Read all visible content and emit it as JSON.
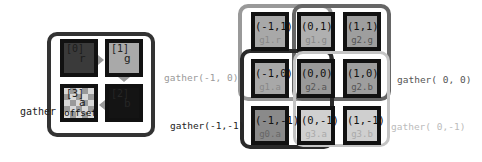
{
  "left_panel": {
    "label": "gather",
    "cells": [
      {
        "index": "[0]",
        "channel": "r",
        "color": "#3a3a3a"
      },
      {
        "index": "[1]",
        "channel": "g",
        "color": "#a9a9a9"
      },
      {
        "index": "[2]",
        "channel": "b",
        "color": "#141414"
      },
      {
        "index": "[3]",
        "channel": "a",
        "extra": "offset",
        "color": "checker"
      }
    ],
    "arrows": [
      "right",
      "down",
      "left"
    ]
  },
  "right_grid": {
    "cells": [
      {
        "coord": "(-1,1)",
        "src": "g1.r",
        "color": "#a8a8a8"
      },
      {
        "coord": "(0,1)",
        "src": "g1.g",
        "color": "#b0b0b0"
      },
      {
        "coord": "(1,1)",
        "src": "g2.g",
        "color": "#9e9e9e"
      },
      {
        "coord": "(-1,0)",
        "src": "g1.a",
        "color": "#a8a8a8"
      },
      {
        "coord": "(0,0)",
        "src": "g2.a",
        "color": "#9a9a9a"
      },
      {
        "coord": "(1,0)",
        "src": "g2.b",
        "color": "#9e9e9e"
      },
      {
        "coord": "(-1,-1)",
        "src": "g0.a",
        "color": "#8a8a8a"
      },
      {
        "coord": "(0,-1)",
        "src": "g3.a",
        "color": "#d0d0d0"
      },
      {
        "coord": "(1,-1)",
        "src": "g3.b",
        "color": "#cfcfcf"
      }
    ],
    "labels": {
      "g1": "gather(-1, 0)",
      "g2": "gather( 0, 0)",
      "g0": "gather(-1,-1)",
      "g3": "gather( 0,-1)"
    },
    "label_colors": {
      "g1": "#9a9a9a",
      "g2": "#555555",
      "g0": "#222222",
      "g3": "#bbbbbb"
    }
  }
}
